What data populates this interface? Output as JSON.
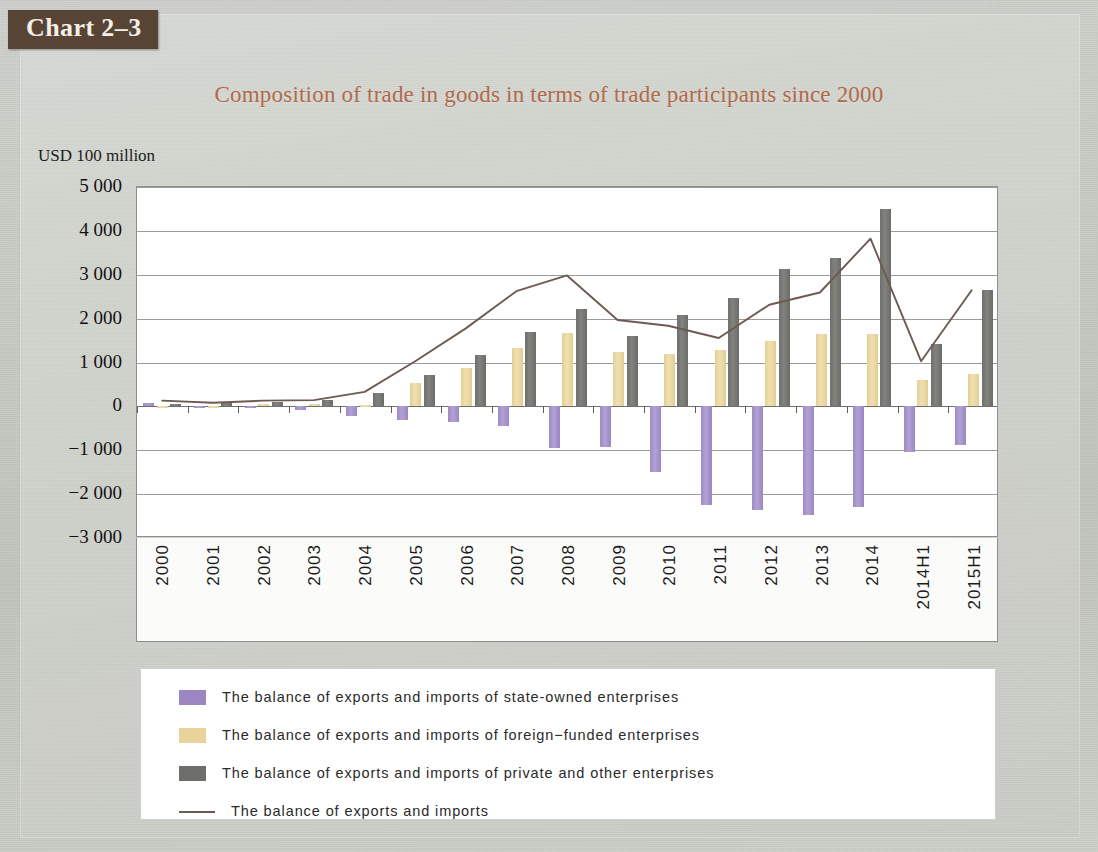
{
  "badge": {
    "label": "Chart 2–3"
  },
  "title": "Composition of trade in goods in terms of trade participants since 2000",
  "axis": {
    "y_unit": "USD 100 million",
    "y_ticks": [
      "5 000",
      "4 000",
      "3 000",
      "2 000",
      "1 000",
      "0",
      "−1 000",
      "−2 000",
      "−3 000"
    ]
  },
  "legend": {
    "items": [
      {
        "marker": "swatch-purple",
        "label": "The balance of exports and imports of state-owned enterprises"
      },
      {
        "marker": "swatch-tan",
        "label": "The balance of exports and imports of foreign−funded enterprises"
      },
      {
        "marker": "swatch-gray",
        "label": "The balance of exports and imports of private and other enterprises"
      },
      {
        "marker": "line-marker",
        "label": "The balance of exports and imports"
      }
    ]
  },
  "colors": {
    "state_owned": "#9b86c2",
    "foreign_funded": "#e8d49a",
    "private_other": "#6e6e6b",
    "total_line": "#6d5a52",
    "title": "#b06a4a",
    "badge_bg": "#574434",
    "page_bg": "#c9cbc6",
    "plot_bg": "#ffffff"
  },
  "chart_data": {
    "type": "bar",
    "title": "Composition of trade in goods in terms of trade participants since 2000",
    "xlabel": "",
    "ylabel": "USD 100 million",
    "ylim": [
      -3000,
      5000
    ],
    "ytick_step": 1000,
    "grid": true,
    "legend_position": "bottom",
    "categories": [
      "2000",
      "2001",
      "2002",
      "2003",
      "2004",
      "2005",
      "2006",
      "2007",
      "2008",
      "2009",
      "2010",
      "2011",
      "2012",
      "2013",
      "2014",
      "2014H1",
      "2015H1"
    ],
    "series": [
      {
        "name": "The balance of exports and imports of state-owned enterprises",
        "type": "bar",
        "color": "#9b86c2",
        "values": [
          80,
          -40,
          -40,
          -80,
          -230,
          -320,
          -360,
          -450,
          -950,
          -920,
          -1500,
          -2240,
          -2360,
          -2470,
          -2300,
          -1040,
          -870
        ]
      },
      {
        "name": "The balance of exports and imports of foreign−funded enterprises",
        "type": "bar",
        "color": "#e8d49a",
        "values": [
          -20,
          -20,
          50,
          50,
          20,
          540,
          880,
          1320,
          1680,
          1250,
          1200,
          1290,
          1500,
          1660,
          1640,
          600,
          740
        ]
      },
      {
        "name": "The balance of exports and imports of private and other enterprises",
        "type": "bar",
        "color": "#6e6e6b",
        "values": [
          60,
          70,
          110,
          150,
          300,
          720,
          1180,
          1690,
          2230,
          1600,
          2090,
          2470,
          3140,
          3380,
          4490,
          1430,
          2660
        ]
      },
      {
        "name": "The balance of exports and imports",
        "type": "line",
        "color": "#6d5a52",
        "values": [
          120,
          70,
          120,
          130,
          320,
          1020,
          1770,
          2620,
          2980,
          1960,
          1830,
          1550,
          2310,
          2590,
          3820,
          1020,
          2640
        ]
      }
    ]
  }
}
